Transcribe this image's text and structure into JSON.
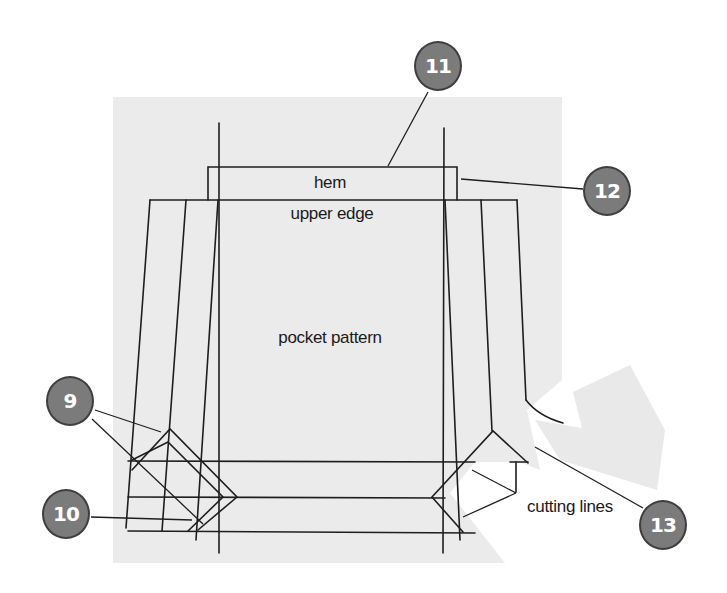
{
  "diagram": {
    "labels": {
      "hem": "hem",
      "upper_edge": "upper edge",
      "pocket_pattern": "pocket pattern",
      "cutting_lines": "cutting lines"
    },
    "callouts": [
      {
        "id": "9",
        "label": "9",
        "x": 70,
        "y": 401
      },
      {
        "id": "10",
        "label": "10",
        "x": 66,
        "y": 514
      },
      {
        "id": "11",
        "label": "11",
        "x": 438,
        "y": 66
      },
      {
        "id": "12",
        "label": "12",
        "x": 607,
        "y": 191
      },
      {
        "id": "13",
        "label": "13",
        "x": 663,
        "y": 525
      }
    ],
    "colors": {
      "paper": "#ebebeb",
      "ink": "#1e1e1e",
      "badge_fill": "#7b7b7b",
      "badge_border": "#3e3e3e",
      "badge_text": "#ffffff",
      "background": "#ffffff"
    }
  }
}
